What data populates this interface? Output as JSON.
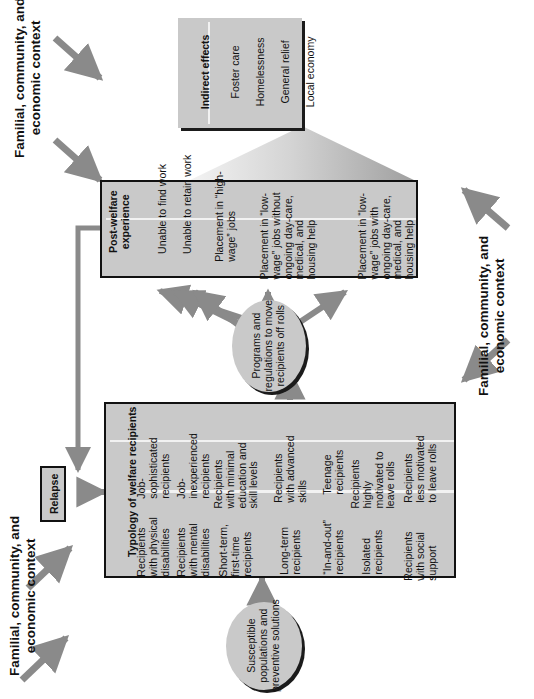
{
  "diagram": {
    "colors": {
      "box_fill": "#c9c9c9",
      "arrow": "#8a8a8a",
      "shadow": "#1b1b1b",
      "divider": "#f2f2f2",
      "text": "#111111",
      "triangle_light": "#efefef",
      "triangle_dark": "#9a9a9a"
    }
  },
  "indirect_effects": {
    "header": "Indirect effects",
    "items": [
      "Foster care",
      "Homelessness",
      "General  relief",
      "Local economy"
    ]
  },
  "post_welfare": {
    "header": "Post-welfare experience",
    "items": [
      "Unable to find work",
      "Unable to retain work",
      "Placement in “high-wage” jobs",
      "Placement in “low-wage” jobs without ongoing day-care, medical, and housing help",
      "Placement in “low-wage” jobs with ongoing day-care, medical, and housing help"
    ]
  },
  "programs_ellipse": {
    "label": "Programs and regulations to move recipients off rolls"
  },
  "typology": {
    "header": "Typology of welfare recipients",
    "row_top": [
      "Recipients with physical disabilities",
      "Recipients with mental disabilities",
      "Short-term, first-time recipients",
      "Long-term recipients",
      "“In-and-out” recipients",
      "Isolated recipients",
      "Recipients with social support"
    ],
    "row_bottom": [
      "Job-sophisticated recipients",
      "Job-inexperienced recipients",
      "Recipients with minimal education and skill levels",
      "Recipients with advanced skills",
      "Teenage recipients",
      "Recipients highly motivated to leave rolls",
      "Recipients less motivated to leave rolls"
    ]
  },
  "susceptible_ellipse": {
    "label": "Susceptible populations and preventive solutions"
  },
  "relapse": {
    "label": "Relapse"
  },
  "context_labels": {
    "top_left": "Familial, community, and economic context",
    "bottom_left": "Familial, community, and economic context",
    "right": "Familial, community, and economic context"
  }
}
